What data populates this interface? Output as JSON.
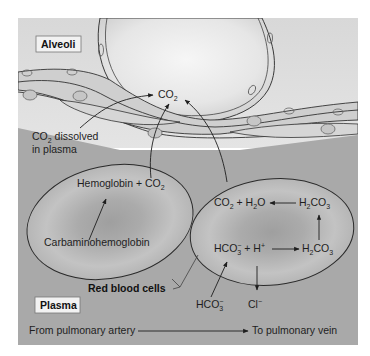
{
  "diagram": {
    "colors": {
      "alveolar_space": "#dcdcdc",
      "plasma": "#a9a9a9",
      "capillary_wall": "#cfcfcf",
      "rbc_fill": "#bdbdbd",
      "rbc_center": "#a3a3a3",
      "line": "#2a2a2a",
      "label_box": "#f2f2f2"
    },
    "regions": {
      "alveoli_label": "Alveoli",
      "plasma_label": "Plasma",
      "red_blood_cells_label": "Red blood cells"
    },
    "labels": {
      "co2_top": {
        "main": "CO",
        "sub": "2"
      },
      "co2_dissolved_line1": {
        "main": "CO",
        "sub": "2",
        "rest": " dissolved"
      },
      "co2_dissolved_line2": "in plasma",
      "flow_from": "From pulmonary artery",
      "flow_to": "To pulmonary vein"
    },
    "left_cell": {
      "top_reaction": {
        "main": "Hemoglobin + CO",
        "sub": "2"
      },
      "bottom_reaction": "Carbaminohemoglobin"
    },
    "right_cell": {
      "co2_h2o": {
        "a": "CO",
        "a_sub": "2",
        "b": " + H",
        "b_sub": "2",
        "c": "O"
      },
      "h2co3_top": {
        "a": "H",
        "a_sub": "2",
        "b": "CO",
        "b_sub": "3"
      },
      "hco3_h": {
        "a": "HCO",
        "a_sub": "3",
        "a_sup": "−",
        "b": " + H",
        "b_sup": "+"
      },
      "h2co3_bottom": {
        "a": "H",
        "a_sub": "2",
        "b": "CO",
        "b_sub": "3"
      }
    },
    "outside_ions": {
      "hco3": {
        "a": "HCO",
        "a_sub": "3",
        "a_sup": "−"
      },
      "cl": {
        "a": "Cl",
        "a_sup": "−"
      }
    }
  }
}
